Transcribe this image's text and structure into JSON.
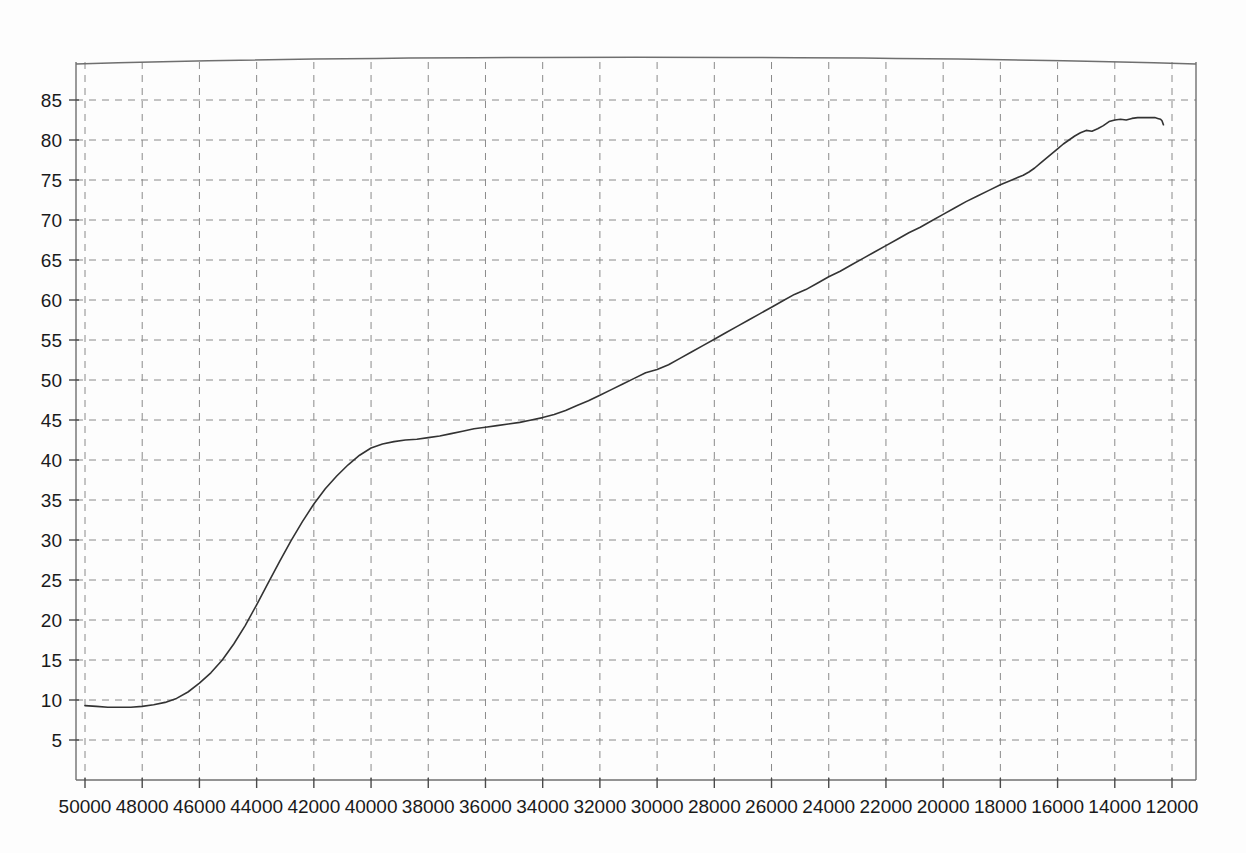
{
  "chart_data": {
    "type": "line",
    "title": "",
    "subtitle": "",
    "xlabel": "",
    "ylabel": "",
    "xlim": [
      50000,
      12000
    ],
    "ylim": [
      2.5,
      88
    ],
    "x_axis_reversed": true,
    "grid": true,
    "grid_style": "dashed",
    "legend": "none",
    "xticks": [
      50000,
      48000,
      46000,
      44000,
      42000,
      40000,
      38000,
      36000,
      34000,
      32000,
      30000,
      28000,
      26000,
      24000,
      22000,
      20000,
      18000,
      16000,
      14000,
      12000
    ],
    "xtick_labels": [
      "50000",
      "48000",
      "46000",
      "44000",
      "42000",
      "40000",
      "38000",
      "36000",
      "34000",
      "32000",
      "30000",
      "28000",
      "26000",
      "24000",
      "22000",
      "20000",
      "18000",
      "16000",
      "14000",
      "12000"
    ],
    "yticks": [
      5,
      10,
      15,
      20,
      25,
      30,
      35,
      40,
      45,
      50,
      55,
      60,
      65,
      70,
      75,
      80,
      85
    ],
    "ytick_labels": [
      "5",
      "10",
      "15",
      "20",
      "25",
      "30",
      "35",
      "40",
      "45",
      "50",
      "55",
      "60",
      "65",
      "70",
      "75",
      "80",
      "85"
    ],
    "series": [
      {
        "name": "curve",
        "color": "#333333",
        "x": [
          50000,
          49600,
          49200,
          48800,
          48400,
          48000,
          47600,
          47200,
          46800,
          46400,
          46000,
          45600,
          45200,
          44800,
          44400,
          44000,
          43600,
          43200,
          42800,
          42400,
          42000,
          41600,
          41200,
          40800,
          40400,
          40000,
          39600,
          39200,
          38800,
          38400,
          38000,
          37600,
          37200,
          36800,
          36400,
          36000,
          35600,
          35200,
          34800,
          34400,
          34000,
          33600,
          33200,
          32800,
          32400,
          32000,
          31600,
          31200,
          30800,
          30400,
          30000,
          29600,
          29200,
          28800,
          28400,
          28000,
          27600,
          27200,
          26800,
          26400,
          26000,
          25600,
          25200,
          24800,
          24400,
          24000,
          23600,
          23200,
          22800,
          22400,
          22000,
          21600,
          21200,
          20800,
          20400,
          20000,
          19600,
          19200,
          18800,
          18400,
          18000,
          17600,
          17200,
          17000,
          16800,
          16600,
          16400,
          16200,
          16000,
          15800,
          15600,
          15400,
          15200,
          15000,
          14800,
          14600,
          14400,
          14200,
          14000,
          13800,
          13600,
          13400,
          13200,
          13000,
          12800,
          12600,
          12500,
          12400,
          12350,
          12300
        ],
        "y": [
          9.3,
          9.2,
          9.1,
          9.1,
          9.1,
          9.2,
          9.4,
          9.7,
          10.2,
          11.0,
          12.1,
          13.4,
          15.0,
          17.0,
          19.3,
          21.9,
          24.6,
          27.3,
          29.9,
          32.3,
          34.5,
          36.4,
          38.0,
          39.4,
          40.6,
          41.5,
          42.0,
          42.3,
          42.5,
          42.6,
          42.8,
          43.0,
          43.3,
          43.6,
          43.9,
          44.1,
          44.3,
          44.5,
          44.7,
          45.0,
          45.3,
          45.7,
          46.2,
          46.8,
          47.4,
          48.1,
          48.8,
          49.5,
          50.2,
          50.9,
          51.3,
          51.9,
          52.7,
          53.5,
          54.3,
          55.1,
          55.9,
          56.7,
          57.5,
          58.3,
          59.1,
          59.9,
          60.7,
          61.3,
          62.1,
          62.9,
          63.6,
          64.4,
          65.2,
          66.0,
          66.8,
          67.6,
          68.4,
          69.1,
          69.9,
          70.7,
          71.5,
          72.3,
          73.0,
          73.7,
          74.4,
          75.0,
          75.6,
          76.0,
          76.5,
          77.1,
          77.7,
          78.3,
          78.9,
          79.5,
          80.0,
          80.5,
          80.9,
          81.2,
          81.1,
          81.4,
          81.8,
          82.3,
          82.5,
          82.6,
          82.5,
          82.7,
          82.8,
          82.8,
          82.8,
          82.8,
          82.7,
          82.6,
          82.4,
          81.9
        ]
      }
    ]
  }
}
